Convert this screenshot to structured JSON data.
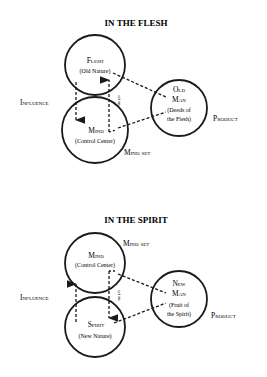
{
  "diagrams": [
    {
      "title": "IN THE FLESH",
      "top_circle": {
        "name": "Flesh",
        "sub": "(Old Nature)"
      },
      "bottom_circle": {
        "name": "Mind",
        "sub": "(Control Center)"
      },
      "product_circle": {
        "line1": "Old",
        "line2": "Man",
        "sub1": "(Deeds of",
        "sub2": "the Flesh)"
      },
      "labels": {
        "influence": "Influence",
        "product": "Product",
        "mind_set": "Mind set",
        "set_on": "set on"
      }
    },
    {
      "title": "IN THE SPIRIT",
      "top_circle": {
        "name": "Mind",
        "sub": "(Control Center)"
      },
      "bottom_circle": {
        "name": "Spirit",
        "sub": "(New Nature)"
      },
      "product_circle": {
        "line1": "New",
        "line2": "Man",
        "sub1": "(Fruit of",
        "sub2": "the Spirit)"
      },
      "labels": {
        "influence": "Influence",
        "product": "Product",
        "mind_set": "Mind set",
        "set_on": "set on"
      }
    }
  ],
  "colors": {
    "ink": "#1a1a1a",
    "background": "#ffffff"
  }
}
